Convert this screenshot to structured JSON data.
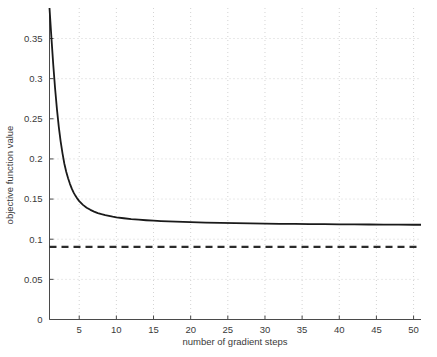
{
  "chart_data": {
    "type": "line",
    "title": "",
    "xlabel": "number of gradient steps",
    "ylabel": "objective function value",
    "xlim": [
      1,
      51
    ],
    "ylim": [
      0,
      0.388
    ],
    "grid": true,
    "grid_style": "dotted",
    "legend_position": "none",
    "xticks": [
      5,
      10,
      15,
      20,
      25,
      30,
      35,
      40,
      45,
      50
    ],
    "xticklabels": [
      "5",
      "10",
      "15",
      "20",
      "25",
      "30",
      "35",
      "40",
      "45",
      "50"
    ],
    "yticks": [
      0,
      0.05,
      0.1,
      0.15,
      0.2,
      0.25,
      0.3,
      0.35
    ],
    "yticklabels": [
      "0",
      "0.05",
      "0.1",
      "0.15",
      "0.2",
      "0.25",
      "0.3",
      "0.35"
    ],
    "series": [
      {
        "name": "objective function value",
        "style": "solid",
        "color": "#1a1a1a",
        "width": 1.8,
        "x": [
          1,
          1.25,
          1.5,
          1.75,
          2,
          2.25,
          2.5,
          2.75,
          3,
          3.25,
          3.5,
          3.75,
          4,
          4.25,
          4.5,
          4.75,
          5,
          5.5,
          6,
          6.5,
          7,
          7.5,
          8,
          8.5,
          9,
          9.5,
          10,
          11,
          12,
          13,
          14,
          15,
          16,
          17,
          18,
          19,
          20,
          22,
          24,
          26,
          28,
          30,
          32,
          34,
          36,
          38,
          40,
          42,
          44,
          46,
          48,
          50,
          51
        ],
        "y": [
          0.388,
          0.352,
          0.318,
          0.288,
          0.262,
          0.24,
          0.222,
          0.207,
          0.194,
          0.184,
          0.176,
          0.169,
          0.163,
          0.158,
          0.154,
          0.1505,
          0.1475,
          0.1428,
          0.1393,
          0.1366,
          0.1344,
          0.1326,
          0.1312,
          0.13,
          0.129,
          0.1281,
          0.1273,
          0.1261,
          0.1251,
          0.1243,
          0.1236,
          0.1231,
          0.1226,
          0.1222,
          0.1218,
          0.1215,
          0.1212,
          0.1207,
          0.1203,
          0.12,
          0.1197,
          0.1194,
          0.1192,
          0.119,
          0.1188,
          0.1187,
          0.1185,
          0.1184,
          0.1183,
          0.1182,
          0.1181,
          0.118,
          0.118
        ]
      },
      {
        "name": "reference level",
        "style": "dashed",
        "color": "#2b2b2b",
        "width": 2.2,
        "x": [
          1,
          51
        ],
        "y": [
          0.0905,
          0.0905
        ]
      }
    ]
  },
  "axes": {
    "x_axis_label": "number of gradient steps",
    "y_axis_label": "objective function value"
  }
}
